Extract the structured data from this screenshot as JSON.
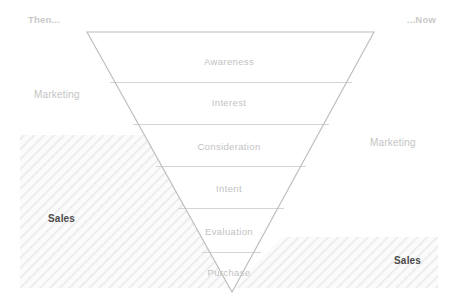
{
  "diagram": {
    "title_then": "Then...",
    "title_now": "...Now",
    "funnel": {
      "stages": [
        {
          "label": "Awareness",
          "center_x": 229,
          "center_y": 61
        },
        {
          "label": "Interest",
          "center_x": 229,
          "center_y": 102
        },
        {
          "label": "Consideration",
          "center_x": 229,
          "center_y": 146
        },
        {
          "label": "Intent",
          "center_x": 229,
          "center_y": 188
        },
        {
          "label": "Evaluation",
          "center_x": 229,
          "center_y": 231
        },
        {
          "label": "Purchase",
          "center_x": 229,
          "center_y": 272
        }
      ],
      "outline_color": "#b9b9b9",
      "divider_color": "#d2d2d2",
      "apex_x": 232,
      "apex_y": 292,
      "top_left_x": 87,
      "top_right_x": 374,
      "top_y": 32
    },
    "regions": {
      "then": {
        "marketing_label": "Marketing",
        "sales_label": "Sales",
        "sales_hatch": {
          "x": 20,
          "y": 135,
          "width": 160,
          "height": 153
        }
      },
      "now": {
        "marketing_label": "Marketing",
        "sales_label": "Sales",
        "sales_hatch": {
          "x": 278,
          "y": 237,
          "width": 160,
          "height": 51
        }
      }
    },
    "colors": {
      "background": "#ffffff",
      "hatch_line": "#ebebeb",
      "hatch_fill": "#fafafa",
      "muted_text": "#c4c4c4",
      "strong_text": "#4a4a4a"
    }
  }
}
